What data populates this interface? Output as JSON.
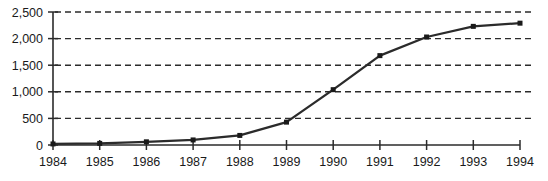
{
  "chart_data": {
    "type": "line",
    "title": "",
    "subtitle": "",
    "xlabel": "",
    "ylabel": "",
    "categories": [
      "1984",
      "1985",
      "1986",
      "1987",
      "1988",
      "1989",
      "1990",
      "1991",
      "1992",
      "1993",
      "1994"
    ],
    "x": [
      1984,
      1985,
      1986,
      1987,
      1988,
      1989,
      1990,
      1991,
      1992,
      1993,
      1994
    ],
    "values": [
      20,
      30,
      60,
      95,
      180,
      430,
      1040,
      1680,
      2030,
      2230,
      2290
    ],
    "series": [
      {
        "name": "",
        "values": [
          20,
          30,
          60,
          95,
          180,
          430,
          1040,
          1680,
          2030,
          2230,
          2290
        ]
      }
    ],
    "ylim": [
      0,
      2500
    ],
    "yticks": [
      0,
      500,
      1000,
      1500,
      2000,
      2500
    ],
    "ytick_labels": [
      "0",
      "500",
      "1,000",
      "1,500",
      "2,000",
      "2,500"
    ],
    "xtick_labels": [
      "1984",
      "1985",
      "1986",
      "1987",
      "1988",
      "1989",
      "1990",
      "1991",
      "1992",
      "1993",
      "1994"
    ],
    "grid": true,
    "grid_style": "dashed-horizontal",
    "legend": false,
    "legend_position": "none",
    "marker": "square",
    "line_color": "#2b2b2b",
    "marker_color": "#1a1a1a",
    "grid_color": "#2b2b2b",
    "axis_color": "#2b2b2b",
    "background_color": "#ffffff",
    "annotations": []
  }
}
